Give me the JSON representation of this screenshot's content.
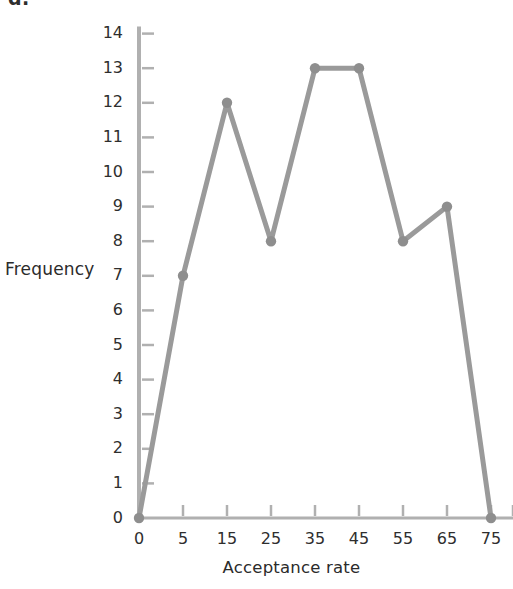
{
  "figure": {
    "part_label": "d.",
    "background_color": "#ffffff",
    "line_color": "#9a9a9a",
    "marker_color": "#8e8e8e",
    "axis_color": "#b0b0b0",
    "text_color": "#2e2e2e"
  },
  "chart_data": {
    "type": "line",
    "title": "",
    "xlabel": "Acceptance rate",
    "ylabel": "Frequency",
    "x": [
      0,
      5,
      15,
      25,
      35,
      45,
      55,
      65,
      75
    ],
    "values": [
      0,
      7,
      12,
      8,
      13,
      13,
      8,
      9,
      0
    ],
    "xtick_labels": [
      "0",
      "5",
      "15",
      "25",
      "35",
      "45",
      "55",
      "65",
      "75"
    ],
    "ytick_labels": [
      "0",
      "1",
      "2",
      "3",
      "4",
      "5",
      "6",
      "7",
      "8",
      "9",
      "10",
      "11",
      "12",
      "13",
      "14"
    ],
    "ylim": [
      0,
      14
    ],
    "xlim": [
      0,
      75
    ],
    "grid": false,
    "legend": false,
    "markers": true,
    "marker_shape": "circle"
  }
}
